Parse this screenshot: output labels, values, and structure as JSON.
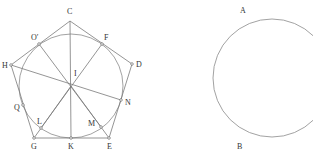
{
  "figure_left": {
    "title": "Regular pentagon with inscribed circle",
    "circle": {
      "cx": 71,
      "cy": 86,
      "r": 52
    },
    "pentagon": [
      "C",
      "D",
      "E",
      "G",
      "H"
    ],
    "points": {
      "C": {
        "x": 70,
        "y": 21,
        "label": "C",
        "lx": 67,
        "ly": 14
      },
      "D": {
        "x": 132,
        "y": 64,
        "label": "D",
        "lx": 136,
        "ly": 67
      },
      "E": {
        "x": 109,
        "y": 138,
        "label": "E",
        "lx": 107,
        "ly": 149
      },
      "G": {
        "x": 34,
        "y": 138,
        "label": "G",
        "lx": 31,
        "ly": 149
      },
      "H": {
        "x": 11,
        "y": 65,
        "label": "H",
        "lx": 2,
        "ly": 68
      },
      "I": {
        "x": 71,
        "y": 86,
        "label": "I",
        "lx": 74,
        "ly": 76
      },
      "K": {
        "x": 71,
        "y": 138,
        "label": "K",
        "lx": 68,
        "ly": 149
      },
      "O'": {
        "x": 39,
        "y": 44,
        "label": "O′",
        "lx": 31,
        "ly": 40
      },
      "F": {
        "x": 102,
        "y": 44,
        "label": "F",
        "lx": 104,
        "ly": 40
      },
      "N": {
        "x": 121,
        "y": 100,
        "label": "N",
        "lx": 125,
        "ly": 105
      },
      "Q": {
        "x": 23,
        "y": 105,
        "label": "Q",
        "lx": 14,
        "ly": 110
      },
      "L": {
        "x": 41,
        "y": 128,
        "label": "L",
        "lx": 37,
        "ly": 124
      },
      "M": {
        "x": 101,
        "y": 127,
        "label": "M",
        "lx": 88,
        "ly": 126
      }
    },
    "segments": [
      [
        "C",
        "D"
      ],
      [
        "D",
        "E"
      ],
      [
        "E",
        "G"
      ],
      [
        "G",
        "H"
      ],
      [
        "H",
        "C"
      ],
      [
        "C",
        "K"
      ],
      [
        "O'",
        "M"
      ],
      [
        "F",
        "L"
      ],
      [
        "H",
        "N"
      ],
      [
        "I",
        "E"
      ],
      [
        "I",
        "G"
      ]
    ]
  },
  "figure_right": {
    "title": "Circle arc",
    "circle": {
      "cx": 272,
      "cy": 78,
      "r": 59
    },
    "labels": {
      "A": {
        "text": "A",
        "x": 240,
        "y": 13
      },
      "B": {
        "text": "B",
        "x": 237,
        "y": 149
      }
    }
  }
}
